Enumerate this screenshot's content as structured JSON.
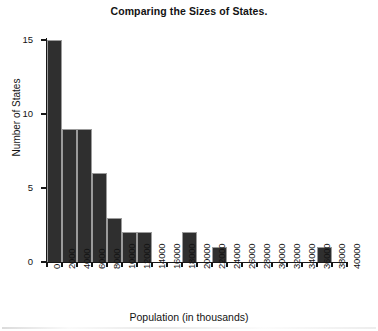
{
  "chart_data": {
    "type": "bar",
    "title": "Comparing the Sizes of States.",
    "xlabel": "Population (in thousands)",
    "ylabel": "Number of States",
    "xlim": [
      0,
      40000
    ],
    "ylim": [
      0,
      15
    ],
    "grid": false,
    "legend": null,
    "bin_width": 2000,
    "bar_color": "#2f2f2f",
    "xticks": [
      "0",
      "2000",
      "4000",
      "6000",
      "8000",
      "10000",
      "12000",
      "14000",
      "16000",
      "18000",
      "20000",
      "22000",
      "24000",
      "26000",
      "28000",
      "30000",
      "32000",
      "34000",
      "36000",
      "38000",
      "40000"
    ],
    "yticks": [
      "0",
      "5",
      "10",
      "15"
    ],
    "bins": [
      {
        "start": 0,
        "end": 2000,
        "value": 15
      },
      {
        "start": 2000,
        "end": 4000,
        "value": 9
      },
      {
        "start": 4000,
        "end": 6000,
        "value": 9
      },
      {
        "start": 6000,
        "end": 8000,
        "value": 6
      },
      {
        "start": 8000,
        "end": 10000,
        "value": 3
      },
      {
        "start": 10000,
        "end": 12000,
        "value": 2
      },
      {
        "start": 12000,
        "end": 14000,
        "value": 2
      },
      {
        "start": 14000,
        "end": 16000,
        "value": 0
      },
      {
        "start": 16000,
        "end": 18000,
        "value": 0
      },
      {
        "start": 18000,
        "end": 20000,
        "value": 2
      },
      {
        "start": 20000,
        "end": 22000,
        "value": 0
      },
      {
        "start": 22000,
        "end": 24000,
        "value": 1
      },
      {
        "start": 24000,
        "end": 26000,
        "value": 0
      },
      {
        "start": 26000,
        "end": 28000,
        "value": 0
      },
      {
        "start": 28000,
        "end": 30000,
        "value": 0
      },
      {
        "start": 30000,
        "end": 32000,
        "value": 0
      },
      {
        "start": 32000,
        "end": 34000,
        "value": 0
      },
      {
        "start": 34000,
        "end": 36000,
        "value": 0
      },
      {
        "start": 36000,
        "end": 38000,
        "value": 1
      },
      {
        "start": 38000,
        "end": 40000,
        "value": 0
      }
    ],
    "categories": [
      "0-2000",
      "2000-4000",
      "4000-6000",
      "6000-8000",
      "8000-10000",
      "10000-12000",
      "12000-14000",
      "14000-16000",
      "16000-18000",
      "18000-20000",
      "20000-22000",
      "22000-24000",
      "24000-26000",
      "26000-28000",
      "28000-30000",
      "30000-32000",
      "32000-34000",
      "34000-36000",
      "36000-38000",
      "38000-40000"
    ],
    "values": [
      15,
      9,
      9,
      6,
      3,
      2,
      2,
      0,
      0,
      2,
      0,
      1,
      0,
      0,
      0,
      0,
      0,
      0,
      1,
      0
    ]
  }
}
